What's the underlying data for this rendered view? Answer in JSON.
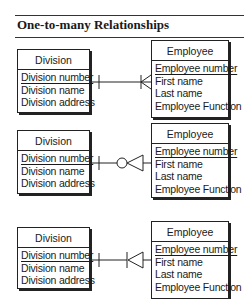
{
  "title": "One-to-many Relationships",
  "relationships": [
    {
      "type": "one-to-many (one or many)",
      "parent": {
        "name": "Division",
        "attributes": [
          {
            "label": "Division number",
            "key": true
          },
          {
            "label": "Division name",
            "key": false
          },
          {
            "label": "Division address",
            "key": false
          }
        ]
      },
      "child": {
        "name": "Employee",
        "attributes": [
          {
            "label": "Employee number",
            "key": true
          },
          {
            "label": "First name",
            "key": false
          },
          {
            "label": "Last name",
            "key": false
          },
          {
            "label": "Employee Function",
            "key": false
          }
        ]
      },
      "parent_end": "one-bar",
      "child_end": "crows-foot-with-bar"
    },
    {
      "type": "one-to-many (zero or many)",
      "parent": {
        "name": "Division",
        "attributes": [
          {
            "label": "Division number",
            "key": true
          },
          {
            "label": "Division name",
            "key": false
          },
          {
            "label": "Division address",
            "key": false
          }
        ]
      },
      "child": {
        "name": "Employee",
        "attributes": [
          {
            "label": "Employee number",
            "key": true
          },
          {
            "label": "First name",
            "key": false
          },
          {
            "label": "Last name",
            "key": false
          },
          {
            "label": "Employee Function",
            "key": false
          }
        ]
      },
      "parent_end": "one-bar",
      "child_end": "circle-plus-crows-foot"
    },
    {
      "type": "one-to-many (one or many, mandatory)",
      "parent": {
        "name": "Division",
        "attributes": [
          {
            "label": "Division number",
            "key": true
          },
          {
            "label": "Division name",
            "key": false
          },
          {
            "label": "Division address",
            "key": false
          }
        ]
      },
      "child": {
        "name": "Employee",
        "attributes": [
          {
            "label": "Employee number",
            "key": true
          },
          {
            "label": "First name",
            "key": false
          },
          {
            "label": "Last name",
            "key": false
          },
          {
            "label": "Employee Function",
            "key": false
          }
        ]
      },
      "parent_end": "one-bar",
      "child_end": "bar-plus-crows-foot"
    }
  ],
  "colors": {
    "ink": "#222222",
    "background": "#ffffff"
  }
}
